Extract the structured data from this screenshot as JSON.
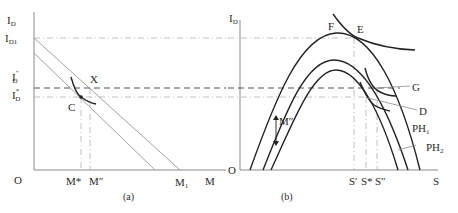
{
  "panel_a": {
    "caption": "(a)",
    "y_axis_label": "I",
    "y_axis_sub": "D",
    "y_ticks": [
      {
        "main": "I",
        "sub": "D1",
        "sup": ""
      },
      {
        "main": "I",
        "sub": "D",
        "sup": "″"
      },
      {
        "main": "I",
        "sub": "D",
        "sup": "*"
      }
    ],
    "origin_label": "O",
    "x_ticks": [
      "M*",
      "M″"
    ],
    "x_tick_m1": {
      "main": "M",
      "sub": "1"
    },
    "x_axis_label": "M",
    "point_labels": {
      "X": "X",
      "C": "C"
    }
  },
  "panel_b": {
    "caption": "(b)",
    "y_axis_label": "I",
    "y_axis_sub": "D",
    "origin_label": "O",
    "x_ticks": [
      "S′",
      "S*",
      "S″"
    ],
    "x_axis_label": "S",
    "point_labels": {
      "F": "F",
      "E": "E",
      "G": "G",
      "D": "D"
    },
    "curve_labels": [
      {
        "main": "PH",
        "sub": "1"
      },
      {
        "main": "PH",
        "sub": "2"
      }
    ],
    "shift_label": "M″"
  }
}
